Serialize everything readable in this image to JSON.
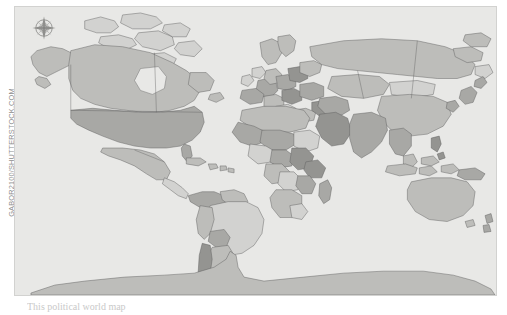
{
  "figure": {
    "title": "World Map",
    "credit": "GABOR2100/SHUTTERSTOCK.COM",
    "caption": "This political world map",
    "compass_label": "compass-rose"
  },
  "palette": {
    "page_background": "#ffffff",
    "ocean": "#e8e8e6",
    "plate_border": "#d2d2d0",
    "country_border": "#5c5c5c",
    "credit_text": "#8e8e8e",
    "caption_text": "#c9c9c9",
    "fill_lightest": "#e0e0de",
    "fill_light": "#d2d2d0",
    "fill_mid": "#bdbdba",
    "fill_dark": "#a8a8a5",
    "fill_darkest": "#949491"
  },
  "map": {
    "projection": "equirectangular",
    "style": "political-grayscale",
    "has_country_borders": true,
    "regions": [
      {
        "name": "Alaska",
        "shade": "#bdbdba"
      },
      {
        "name": "Canada",
        "shade": "#bdbdba"
      },
      {
        "name": "United States",
        "shade": "#a8a8a5"
      },
      {
        "name": "Greenland",
        "shade": "#a8a8a5"
      },
      {
        "name": "Mexico",
        "shade": "#bdbdba"
      },
      {
        "name": "Central America",
        "shade": "#d2d2d0"
      },
      {
        "name": "Caribbean",
        "shade": "#bdbdba"
      },
      {
        "name": "Colombia",
        "shade": "#a8a8a5"
      },
      {
        "name": "Venezuela",
        "shade": "#bdbdba"
      },
      {
        "name": "Brazil",
        "shade": "#d2d2d0"
      },
      {
        "name": "Peru",
        "shade": "#bdbdba"
      },
      {
        "name": "Bolivia",
        "shade": "#a8a8a5"
      },
      {
        "name": "Argentina",
        "shade": "#bdbdba"
      },
      {
        "name": "Chile",
        "shade": "#949491"
      },
      {
        "name": "Scandinavia",
        "shade": "#bdbdba"
      },
      {
        "name": "Western Europe",
        "shade": "#a8a8a5"
      },
      {
        "name": "Eastern Europe",
        "shade": "#949491"
      },
      {
        "name": "Russia",
        "shade": "#bdbdba"
      },
      {
        "name": "North Africa",
        "shade": "#bdbdba"
      },
      {
        "name": "Sahel",
        "shade": "#a8a8a5"
      },
      {
        "name": "Central Africa",
        "shade": "#d2d2d0"
      },
      {
        "name": "East Africa",
        "shade": "#949491"
      },
      {
        "name": "Southern Africa",
        "shade": "#bdbdba"
      },
      {
        "name": "Madagascar",
        "shade": "#a8a8a5"
      },
      {
        "name": "Middle East",
        "shade": "#a8a8a5"
      },
      {
        "name": "Arabian Peninsula",
        "shade": "#949491"
      },
      {
        "name": "Central Asia",
        "shade": "#bdbdba"
      },
      {
        "name": "India",
        "shade": "#a8a8a5"
      },
      {
        "name": "China",
        "shade": "#bdbdba"
      },
      {
        "name": "Mongolia",
        "shade": "#d2d2d0"
      },
      {
        "name": "Southeast Asia",
        "shade": "#a8a8a5"
      },
      {
        "name": "Indonesia",
        "shade": "#bdbdba"
      },
      {
        "name": "Philippines",
        "shade": "#949491"
      },
      {
        "name": "Japan",
        "shade": "#a8a8a5"
      },
      {
        "name": "Australia",
        "shade": "#bdbdba"
      },
      {
        "name": "New Zealand",
        "shade": "#a8a8a5"
      },
      {
        "name": "Papua New Guinea",
        "shade": "#a8a8a5"
      },
      {
        "name": "Antarctica",
        "shade": "#bdbdba"
      }
    ]
  }
}
